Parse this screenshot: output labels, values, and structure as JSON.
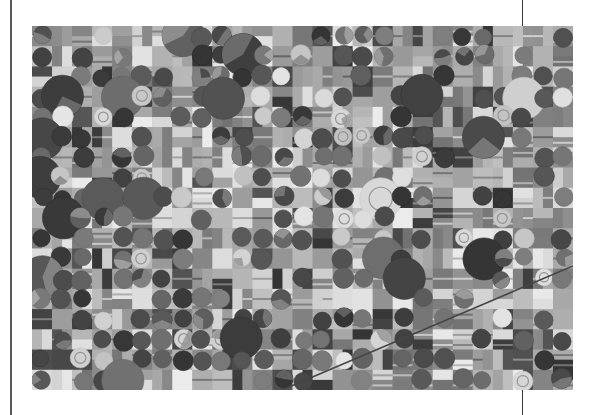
{
  "page": {
    "background": "#ffffff",
    "left_rule": {
      "x": 10,
      "width": 2,
      "color": "#5a5a5a"
    },
    "top_tick": {
      "x": 522,
      "y0": 0,
      "y1": 26
    },
    "bottom_tick": {
      "x": 522,
      "y0": 390,
      "y1": 415
    }
  },
  "image": {
    "subject": "grayscale satellite view of farmland with center-pivot irrigation circles and rectangular fields",
    "x": 32,
    "y": 26,
    "width": 541,
    "height": 364,
    "grid": {
      "cols": 27,
      "rows": 18,
      "seed": 7
    },
    "road": {
      "x1": 250,
      "y1": 364,
      "x2": 541,
      "y2": 240,
      "color": "#3c3c3c"
    }
  }
}
